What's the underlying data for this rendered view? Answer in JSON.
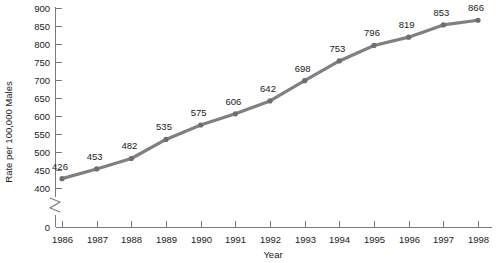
{
  "chart_data": {
    "type": "line",
    "title": "",
    "xlabel": "Year",
    "ylabel": "Rate per 100,000 Males",
    "categories": [
      "1986",
      "1987",
      "1988",
      "1989",
      "1990",
      "1991",
      "1992",
      "1993",
      "1994",
      "1995",
      "1996",
      "1997",
      "1998"
    ],
    "x": [
      1986,
      1987,
      1988,
      1989,
      1990,
      1991,
      1992,
      1993,
      1994,
      1995,
      1996,
      1997,
      1998
    ],
    "values": [
      426,
      453,
      482,
      535,
      575,
      606,
      642,
      698,
      753,
      796,
      819,
      853,
      866
    ],
    "point_labels": [
      "426",
      "453",
      "482",
      "535",
      "575",
      "606",
      "642",
      "698",
      "753",
      "796",
      "819",
      "853",
      "866"
    ],
    "ylim": [
      400,
      900
    ],
    "y_ticks": [
      400,
      450,
      500,
      550,
      600,
      650,
      700,
      750,
      800,
      850,
      900
    ],
    "y_tick_labels": [
      "400",
      "450",
      "500",
      "550",
      "600",
      "650",
      "700",
      "750",
      "800",
      "850",
      "900"
    ],
    "y_origin_tick_label": "0",
    "axis_break": true,
    "grid": false,
    "legend": false,
    "legend_position": "none",
    "series": [
      {
        "name": "Rate per 100,000 Males",
        "color": "#808080",
        "values": [
          426,
          453,
          482,
          535,
          575,
          606,
          642,
          698,
          753,
          796,
          819,
          853,
          866
        ]
      }
    ],
    "colors": {
      "line": "#808080",
      "marker": "#6e6e6e",
      "axis": "#7a7a7a",
      "text": "#1a1a1a",
      "background": "#ffffff"
    }
  }
}
